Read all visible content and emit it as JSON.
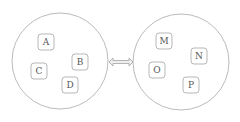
{
  "diagram": {
    "left_group": {
      "nodes": [
        {
          "label": "A",
          "x": 46,
          "y": 42
        },
        {
          "label": "B",
          "x": 80,
          "y": 62
        },
        {
          "label": "C",
          "x": 39,
          "y": 71
        },
        {
          "label": "D",
          "x": 70,
          "y": 85
        }
      ]
    },
    "right_group": {
      "nodes": [
        {
          "label": "M",
          "x": 164,
          "y": 41
        },
        {
          "label": "N",
          "x": 199,
          "y": 56
        },
        {
          "label": "O",
          "x": 157,
          "y": 70
        },
        {
          "label": "P",
          "x": 191,
          "y": 85
        }
      ]
    },
    "connector": {
      "type": "double-arrow"
    },
    "colors": {
      "stroke": "#999999",
      "text": "#555555",
      "background": "#ffffff"
    }
  }
}
